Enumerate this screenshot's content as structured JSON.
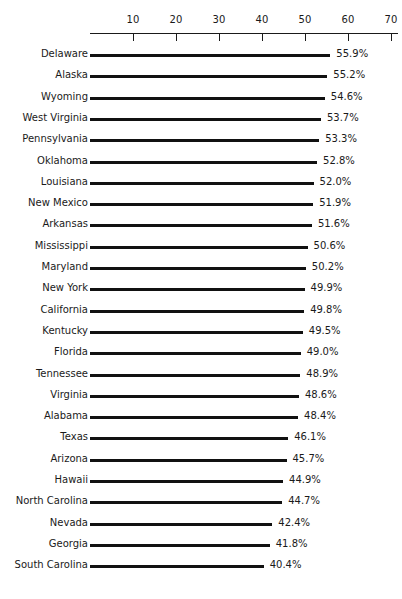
{
  "chart_data": {
    "type": "bar",
    "orientation": "horizontal",
    "title": "",
    "subtitle": "",
    "xlabel": "",
    "ylabel": "",
    "xlim": [
      0,
      72
    ],
    "grid": false,
    "legend": null,
    "axis_position": "top",
    "value_suffix": "%",
    "tick_values": [
      10,
      20,
      30,
      40,
      50,
      60,
      70
    ],
    "tick_labels": [
      "10",
      "20",
      "30",
      "40",
      "50",
      "60",
      "70"
    ],
    "categories": [
      "Delaware",
      "Alaska",
      "Wyoming",
      "West Virginia",
      "Pennsylvania",
      "Oklahoma",
      "Louisiana",
      "New Mexico",
      "Arkansas",
      "Mississippi",
      "Maryland",
      "New York",
      "California",
      "Kentucky",
      "Florida",
      "Tennessee",
      "Virginia",
      "Alabama",
      "Texas",
      "Arizona",
      "Hawaii",
      "North Carolina",
      "Nevada",
      "Georgia",
      "South Carolina"
    ],
    "values": [
      55.9,
      55.2,
      54.6,
      53.7,
      53.3,
      52.8,
      52.0,
      51.9,
      51.6,
      50.6,
      50.2,
      49.9,
      49.8,
      49.5,
      49.0,
      48.9,
      48.6,
      48.4,
      46.1,
      45.7,
      44.9,
      44.7,
      42.4,
      41.8,
      40.4
    ],
    "value_labels": [
      "55.9%",
      "55.2%",
      "54.6%",
      "53.7%",
      "53.3%",
      "52.8%",
      "52.0%",
      "51.9%",
      "51.6%",
      "50.6%",
      "50.2%",
      "49.9%",
      "49.8%",
      "49.5%",
      "49.0%",
      "48.9%",
      "48.6%",
      "48.4%",
      "46.1%",
      "45.7%",
      "44.9%",
      "44.7%",
      "42.4%",
      "41.8%",
      "40.4%"
    ],
    "colors": {
      "bar": "#111111",
      "axis": "#1a1a1a",
      "text": "#1a1a1a",
      "background": "#ffffff"
    }
  },
  "layout": {
    "origin_x_px": 90,
    "px_per_unit": 4.3,
    "row_pitch_px": 21.3,
    "value_gap_px": 6
  }
}
